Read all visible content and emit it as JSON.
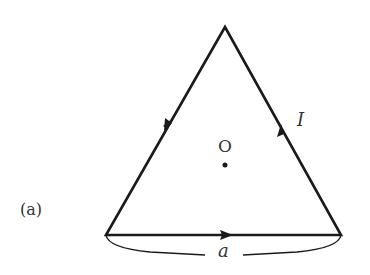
{
  "figure": {
    "panel_label": "(a)",
    "center_label": "O",
    "current_label": "I",
    "side_label": "a"
  },
  "colors": {
    "stroke": "#1a1a1a",
    "text": "#333333"
  }
}
